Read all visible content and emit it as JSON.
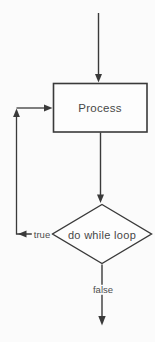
{
  "diagram": {
    "type": "flowchart",
    "nodes": {
      "process": {
        "label": "Process",
        "shape": "rectangle"
      },
      "decision": {
        "label": "do while loop",
        "shape": "diamond"
      }
    },
    "edges": {
      "entry": {
        "from": "start",
        "to": "process",
        "label": ""
      },
      "process_to_decision": {
        "from": "process",
        "to": "decision",
        "label": ""
      },
      "loop_back": {
        "from": "decision",
        "to": "process",
        "label": "true"
      },
      "exit": {
        "from": "decision",
        "to": "end",
        "label": "false"
      }
    },
    "colors": {
      "line": "#3a3a3a",
      "text": "#474747",
      "background": "#fbfbfb",
      "node_fill": "#fdfdfd"
    }
  }
}
